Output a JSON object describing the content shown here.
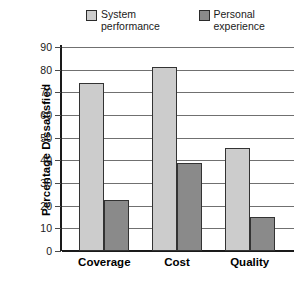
{
  "chart_data": {
    "type": "bar",
    "title": "",
    "xlabel": "",
    "ylabel": "Percentage Dissatisfied",
    "categories": [
      "Coverage",
      "Cost",
      "Quality"
    ],
    "series": [
      {
        "name": "System performance",
        "values": [
          74,
          81,
          45.5
        ],
        "color": "#cccccc"
      },
      {
        "name": "Personal experience",
        "values": [
          22.5,
          39,
          15
        ],
        "color": "#8a8a8a"
      }
    ],
    "ylim": [
      0,
      90
    ],
    "yticks": [
      0,
      10,
      20,
      30,
      40,
      50,
      60,
      70,
      80,
      90
    ],
    "ytick_labels": [
      "0",
      "10",
      "20",
      "30",
      "40",
      "50",
      "60",
      "70",
      "80",
      "90"
    ],
    "grid": "horizontal",
    "legend_position": "top"
  },
  "legend": {
    "entries": [
      {
        "label": "System performance",
        "swatch": "light-gray-swatch"
      },
      {
        "label": "Personal experience",
        "swatch": "dark-gray-swatch"
      }
    ]
  },
  "axis": {
    "y_title": "Percentage Dissatisfied"
  }
}
